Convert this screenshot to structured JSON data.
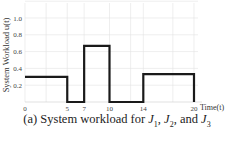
{
  "chart_data": {
    "type": "line",
    "subtype": "step",
    "title": "",
    "xlabel": "Time(t)",
    "ylabel": "System Workload u(t)",
    "x_ticks": [
      0,
      5,
      7,
      10,
      14,
      20
    ],
    "x_tick_labels": [
      "0",
      "5",
      "7",
      "10",
      "14",
      "20"
    ],
    "y_ticks": [
      0.2,
      0.4,
      0.6,
      0.8,
      1.0
    ],
    "y_tick_labels": [
      "0.2",
      "0.4",
      "0.6",
      "0.8",
      "1.0"
    ],
    "xlim": [
      0,
      20.5
    ],
    "ylim": [
      0,
      1.2
    ],
    "grid": true,
    "legend": null,
    "series": [
      {
        "name": "System workload",
        "color": "#1a1a1a",
        "steps": [
          {
            "x_start": 0,
            "x_end": 5,
            "y": 0.3
          },
          {
            "x_start": 5,
            "x_end": 7,
            "y": 0.0
          },
          {
            "x_start": 7,
            "x_end": 10,
            "y": 0.667
          },
          {
            "x_start": 10,
            "x_end": 14,
            "y": 0.0
          },
          {
            "x_start": 14,
            "x_end": 20,
            "y": 0.333
          },
          {
            "x_start": 20,
            "x_end": 20,
            "y": 0.0
          }
        ]
      }
    ]
  },
  "caption": {
    "prefix": "(a) System workload for ",
    "j1": "J",
    "j1_sub": "1",
    "sep1": ", ",
    "j2": "J",
    "j2_sub": "2",
    "sep2": ", and ",
    "j3": "J",
    "j3_sub": "3"
  }
}
